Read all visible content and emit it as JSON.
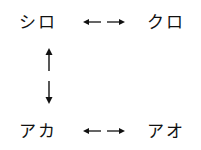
{
  "diagram": {
    "nodes": {
      "top_left": "シロ",
      "top_right": "クロ",
      "bottom_left": "アカ",
      "bottom_right": "アオ"
    },
    "edges": [
      {
        "from": "シロ",
        "to": "クロ",
        "type": "bidirectional-horizontal"
      },
      {
        "from": "シロ",
        "to": "アカ",
        "type": "bidirectional-vertical"
      },
      {
        "from": "アカ",
        "to": "アオ",
        "type": "bidirectional-horizontal"
      }
    ],
    "colors": {
      "text": "#111111",
      "background": "#ffffff"
    }
  }
}
